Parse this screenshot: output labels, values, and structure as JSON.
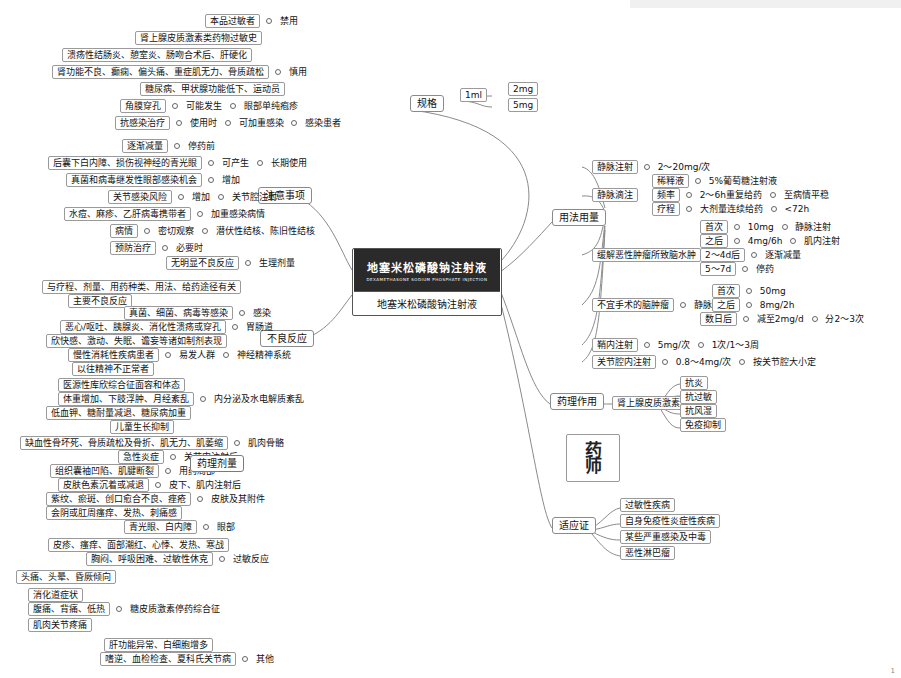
{
  "center": {
    "product_cn": "地塞米松磷酸钠注射液",
    "product_en": "DEXAMETHASONE SODIUM PHOSPHATE INJECTION",
    "caption": "地塞米松磷酸钠注射液"
  },
  "branches": {
    "precautions": "注意事项",
    "adverse": "不良反应",
    "dosage": "用法用量",
    "spec": "规格",
    "pharmacology": "药理作用",
    "indications": "适应证"
  },
  "spec": {
    "items": [
      "1ml",
      "2mg",
      "5mg"
    ]
  },
  "pharmacology": {
    "head": "肾上腺皮质激素类药",
    "items": [
      "抗炎",
      "抗过敏",
      "抗风湿",
      "免疫抑制"
    ]
  },
  "indications": {
    "items": [
      "过敏性疾病",
      "自身免疫性炎症性疾病",
      "某些严重感染及中毒",
      "恶性淋巴瘤"
    ]
  },
  "dosage": {
    "rows": [
      {
        "l1": "静脉注射",
        "l2": "2～20mg/次"
      },
      {
        "l1": "静脉滴注",
        "subs": [
          {
            "k": "稀释液",
            "v": "5%葡萄糖注射液"
          },
          {
            "k": "频率",
            "v": "2～6h重复给药",
            "v2": "至病情平稳"
          },
          {
            "k": "疗程",
            "v": "大剂量连续给药",
            "v2": "<72h"
          }
        ]
      },
      {
        "l1": "缓解恶性肿瘤所致脑水肿",
        "subs": [
          {
            "k": "首次",
            "v": "10mg",
            "v2": "静脉注射"
          },
          {
            "k": "之后",
            "v": "4mg/6h",
            "v2": "肌内注射"
          },
          {
            "k": "2～4d后",
            "v": "逐渐减量"
          },
          {
            "k": "5～7d",
            "v": "停药"
          }
        ]
      },
      {
        "l1": "不宜手术的脑肿瘤",
        "mid": "静脉注射",
        "subs": [
          {
            "k": "首次",
            "v": "50mg"
          },
          {
            "k": "之后",
            "v": "8mg/2h"
          },
          {
            "k": "数日后",
            "v": "减至2mg/d",
            "v2": "分2～3次"
          }
        ]
      },
      {
        "l1": "鞘内注射",
        "l2": "5mg/次",
        "l3": "1次/1～3周"
      },
      {
        "l1": "关节腔内注射",
        "l2": "0.8～4mg/次",
        "l3": "按关节腔大小定"
      }
    ]
  },
  "precautions": {
    "forbidden": {
      "label": "禁用",
      "items": [
        "本品过敏者"
      ]
    },
    "caution": {
      "label": "慎用",
      "items": [
        "肾上腺皮质激素类药物过敏史",
        "溃疡性结肠炎、憩室炎、肠吻合术后、肝硬化",
        "肾功能不良、癫痫、偏头痛、重症肌无力、骨质疏松",
        "糖尿病、甲状腺功能低下、运动员"
      ]
    },
    "glaucoma": {
      "left": "角膜穿孔",
      "mid": "可能发生",
      "right": "眼部单纯疱疹"
    },
    "infection": {
      "left": "抗感染治疗",
      "m1": "使用时",
      "m2": "可加重感染",
      "right": "感染患者"
    },
    "longterm": {
      "label": "长期使用",
      "rows": [
        {
          "l": "逐渐减量",
          "m": "停药前"
        },
        {
          "l": "后囊下白内障、损伤视神经的青光眼",
          "m": "可产生"
        },
        {
          "l": "真菌和病毒继发性眼部感染机会",
          "m": "增加"
        }
      ]
    },
    "joint": {
      "label": "关节腔注射",
      "l": "关节感染风险",
      "m": "增加"
    },
    "latent": {
      "label": "潜伏性结核、陈旧性结核",
      "rows": [
        {
          "l": "水痘、麻疹、乙肝病毒携带者",
          "m": "加重感染病情"
        },
        {
          "l": "病情",
          "m": "密切观察"
        },
        {
          "l": "预防治疗",
          "m": "必要时"
        }
      ]
    }
  },
  "adverse": {
    "physio": {
      "label": "生理剂量",
      "items": [
        "无明显不良反应"
      ]
    },
    "pharma_label": "药理剂量",
    "infection": {
      "label": "感染",
      "rows": [
        {
          "l": "与疗程、剂量、用药种类、用法、给药途径有关"
        },
        {
          "l": "主要不良反应"
        },
        {
          "l": "真菌、细菌、病毒等感染"
        }
      ]
    },
    "gi": {
      "label": "胃肠道",
      "rows": [
        {
          "l": "恶心/呕吐、胰腺炎、消化性溃疡或穿孔"
        },
        {
          "l": "欣快感、激动、失眠、谵妄等诸如制剂表现"
        }
      ]
    },
    "neuro": {
      "label": "神经精神系统",
      "rows": [
        {
          "l": "慢性消耗性疾病患者",
          "m": "易发人群"
        },
        {
          "l": "以往精神不正常者"
        }
      ]
    },
    "endocrine": {
      "label": "内分泌及水电解质紊乱",
      "rows": [
        {
          "l": "医源性库欣综合征面容和体态"
        },
        {
          "l": "体重增加、下肢浮肿、月经紊乱"
        },
        {
          "l": "低血钾、糖耐量减退、糖尿病加重"
        },
        {
          "l": "儿童生长抑制"
        }
      ]
    },
    "muscle": {
      "label": "肌肉骨骼",
      "rows": [
        {
          "l": "缺血性骨坏死、骨质疏松及骨折、肌无力、肌萎缩"
        }
      ]
    },
    "local": {
      "label": "用药局部",
      "sub": "关节内注射后",
      "rows": [
        {
          "l": "急性炎症"
        },
        {
          "l": "组织囊袖凹陷、肌腱断裂"
        }
      ]
    },
    "skin": {
      "label": "皮肤及其附件",
      "sub": "皮下、肌内注射后",
      "rows": [
        {
          "l": "皮肤色素沉着或减退"
        },
        {
          "l": "紫纹、瘀斑、创口愈合不良、痤疮"
        },
        {
          "l": "会阴或肛周瘙痒、发热、刺痛感"
        }
      ]
    },
    "eye": {
      "label": "眼部",
      "rows": [
        {
          "l": "青光眼、白内障"
        }
      ]
    },
    "allergy": {
      "label": "过敏反应",
      "rows": [
        {
          "l": "皮疹、瘙痒、面部潮红、心悸、发热、寒战"
        },
        {
          "l": "胸闷、呼吸困难、过敏性休克"
        }
      ]
    },
    "withdraw": {
      "label": "糖皮质激素停药综合征",
      "rows": [
        {
          "l": "头痛、头晕、昏厥倾向"
        },
        {
          "l": "消化道症状"
        },
        {
          "l": "腹痛、背痛、低热"
        },
        {
          "l": "肌肉关节疼痛"
        }
      ]
    },
    "other": {
      "label": "其他",
      "rows": [
        {
          "l": "肝功能异常、白细胞增多"
        },
        {
          "l": "嗜逆、血检检查、夏科氏关节病"
        }
      ]
    }
  },
  "page_number": "1"
}
